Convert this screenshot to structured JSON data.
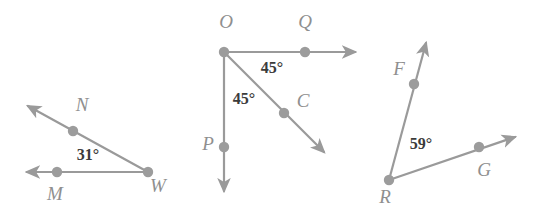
{
  "figure": {
    "line_color": "#9a9a9a",
    "dot_color": "#9c9c9c",
    "label_color": "#8f8f8f",
    "angle_text_color": "#3b3b3b",
    "background": "#ffffff"
  },
  "diagrams": [
    {
      "name": "angle-NWM",
      "vertex": {
        "label": "W",
        "x": 148,
        "y": 172,
        "label_x": 158,
        "label_y": 188
      },
      "rays": [
        {
          "name": "ray-WN",
          "through_point": {
            "label": "N",
            "x": 73,
            "y": 131,
            "label_x": 82,
            "label_y": 107
          },
          "tip_x": 24,
          "tip_y": 103
        },
        {
          "name": "ray-WM",
          "through_point": {
            "label": "M",
            "x": 57,
            "y": 172,
            "label_x": 55,
            "label_y": 196
          },
          "tip_x": 22,
          "tip_y": 172
        }
      ],
      "angle": {
        "value": "31°",
        "x": 88,
        "y": 156
      }
    },
    {
      "name": "angle-QOC-and-COP",
      "vertex": {
        "label": "O",
        "x": 224,
        "y": 52,
        "label_x": 226,
        "label_y": 24
      },
      "rays": [
        {
          "name": "ray-OQ",
          "through_point": {
            "label": "Q",
            "x": 305,
            "y": 52,
            "label_x": 305,
            "label_y": 24
          },
          "tip_x": 360,
          "tip_y": 52
        },
        {
          "name": "ray-OC",
          "through_point": {
            "label": "C",
            "x": 284,
            "y": 113,
            "label_x": 303,
            "label_y": 103
          },
          "tip_x": 328,
          "tip_y": 156
        },
        {
          "name": "ray-OP",
          "through_point": {
            "label": "P",
            "x": 224,
            "y": 147,
            "label_x": 208,
            "label_y": 146
          },
          "tip_x": 224,
          "tip_y": 196
        }
      ],
      "angles": [
        {
          "value": "45°",
          "x": 272,
          "y": 69,
          "name": "angle-QOC"
        },
        {
          "value": "45°",
          "x": 244,
          "y": 100,
          "name": "angle-COP"
        }
      ]
    },
    {
      "name": "angle-FRG",
      "vertex": {
        "label": "R",
        "x": 389,
        "y": 180,
        "label_x": 385,
        "label_y": 199
      },
      "rays": [
        {
          "name": "ray-RF",
          "through_point": {
            "label": "F",
            "x": 414,
            "y": 84,
            "label_x": 399,
            "label_y": 71
          },
          "tip_x": 428,
          "tip_y": 38
        },
        {
          "name": "ray-RG",
          "through_point": {
            "label": "G",
            "x": 479,
            "y": 147,
            "label_x": 484,
            "label_y": 172
          },
          "tip_x": 520,
          "tip_y": 135
        }
      ],
      "angle": {
        "value": "59°",
        "x": 421,
        "y": 145
      }
    }
  ]
}
